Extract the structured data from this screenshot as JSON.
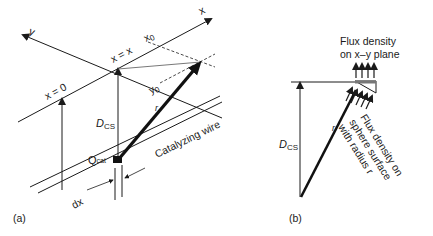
{
  "panel_a": {
    "label": "(a)",
    "axis_x": "x",
    "axis_y": "y",
    "x_eq_x": "x = x",
    "x_eq_0": "x = 0",
    "x0": "x",
    "x0_sub": "0",
    "y0": "y",
    "y0_sub": "0",
    "r": "r",
    "dcs": "D",
    "dcs_sub": "CS",
    "qcat": "Q",
    "qcat_sub": "cat",
    "wire": "Catalyzing wire",
    "dx": "dx"
  },
  "panel_b": {
    "label": "(b)",
    "flux_plane_line1": "Flux density",
    "flux_plane_line2": "on x–y plane",
    "flux_sphere_line1": "Flux density on",
    "flux_sphere_line2": "sphere surface",
    "flux_sphere_line3": "with radius r",
    "r": "r",
    "dcs": "D",
    "dcs_sub": "CS"
  }
}
